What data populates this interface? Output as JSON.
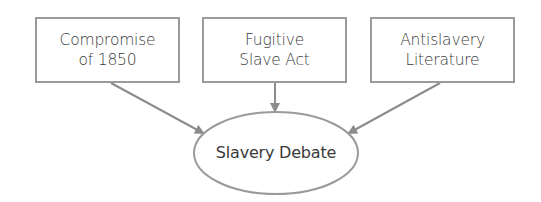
{
  "diagram": {
    "type": "cause-effect",
    "causes": [
      {
        "line1": "Compromise",
        "line2": "of 1850"
      },
      {
        "line1": "Fugitive",
        "line2": "Slave Act"
      },
      {
        "line1": "Antislavery",
        "line2": "Literature"
      }
    ],
    "effect": {
      "label": "Slavery Debate"
    },
    "colors": {
      "border": "#9a9a9a",
      "arrow": "#8c8c8c",
      "text": "#3a3a3a",
      "background": "#ffffff"
    }
  }
}
